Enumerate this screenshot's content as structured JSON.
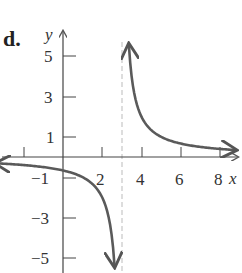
{
  "panel_label": "d.",
  "chart_data": {
    "type": "line",
    "title": "",
    "panel_label": "d.",
    "xlabel": "x",
    "ylabel": "y",
    "function": "y = 2/(x - 3)",
    "vertical_asymptote": 3,
    "horizontal_asymptote": 0,
    "xlim": [
      -3,
      8.5
    ],
    "ylim": [
      -5.5,
      5.5
    ],
    "x_ticks": [
      -2,
      2,
      4,
      6,
      8
    ],
    "x_tick_labels": [
      "2",
      "4",
      "6",
      "8"
    ],
    "y_ticks": [
      5,
      3,
      1,
      -1,
      -3,
      -5
    ],
    "y_tick_labels": [
      "5",
      "3",
      "1",
      "−1",
      "−3",
      "−5"
    ],
    "grid": false,
    "series": [
      {
        "name": "left branch",
        "x": [
          -3,
          -2,
          -1,
          0,
          1,
          2,
          2.5,
          2.63
        ],
        "values": [
          -0.33,
          -0.4,
          -0.5,
          -0.67,
          -1,
          -2,
          -4,
          -5.4
        ]
      },
      {
        "name": "right branch",
        "x": [
          3.36,
          3.5,
          4,
          5,
          6,
          7,
          8,
          8.8
        ],
        "values": [
          5.6,
          4,
          2,
          1,
          0.67,
          0.5,
          0.4,
          0.34
        ]
      }
    ],
    "colors": {
      "curve": "#5a5a5a",
      "axes": "#444444",
      "asymptote": "#bbbbbb"
    }
  }
}
